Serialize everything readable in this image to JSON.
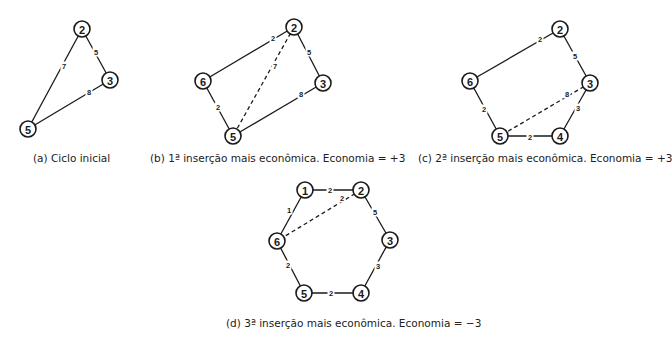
{
  "diagrams": [
    {
      "id": "a",
      "caption": "(a) Ciclo inicial",
      "caption_pos": [
        33,
        152
      ],
      "nodes": [
        {
          "label": "2",
          "x": 82,
          "y": 29
        },
        {
          "label": "3",
          "x": 110,
          "y": 80
        },
        {
          "label": "5",
          "x": 28,
          "y": 129
        }
      ],
      "edges": [
        {
          "from": "2",
          "to": "3",
          "weight": "5",
          "lx": 96,
          "ly": 52,
          "style": "solid"
        },
        {
          "from": "2",
          "to": "5",
          "weight": "7",
          "lx": 64,
          "ly": 66,
          "style": "solid"
        },
        {
          "from": "3",
          "to": "5",
          "weight": "8",
          "lx": 89,
          "ly": 92,
          "style": "solid"
        }
      ]
    },
    {
      "id": "b",
      "caption": "(b) 1ª inserção mais econômica. Economia = +3",
      "caption_pos": [
        150,
        152
      ],
      "nodes": [
        {
          "label": "2",
          "x": 294,
          "y": 27
        },
        {
          "label": "6",
          "x": 203,
          "y": 81
        },
        {
          "label": "3",
          "x": 323,
          "y": 83
        },
        {
          "label": "5",
          "x": 233,
          "y": 136
        }
      ],
      "edges": [
        {
          "from": "2",
          "to": "6",
          "weight": "2",
          "lx": 273,
          "ly": 38,
          "style": "solid"
        },
        {
          "from": "2",
          "to": "3",
          "weight": "5",
          "lx": 309,
          "ly": 52,
          "style": "solid"
        },
        {
          "from": "2",
          "to": "5",
          "weight": "7",
          "lx": 275,
          "ly": 66,
          "style": "dashed"
        },
        {
          "from": "6",
          "to": "5",
          "weight": "2",
          "lx": 218,
          "ly": 107,
          "style": "solid"
        },
        {
          "from": "3",
          "to": "5",
          "weight": "8",
          "lx": 301,
          "ly": 94,
          "style": "solid"
        }
      ]
    },
    {
      "id": "c",
      "caption": "(c) 2ª inserção mais econômica. Economia = +3",
      "caption_pos": [
        418,
        152
      ],
      "nodes": [
        {
          "label": "2",
          "x": 560,
          "y": 29
        },
        {
          "label": "6",
          "x": 470,
          "y": 81
        },
        {
          "label": "3",
          "x": 590,
          "y": 83
        },
        {
          "label": "5",
          "x": 500,
          "y": 136
        },
        {
          "label": "4",
          "x": 560,
          "y": 136
        }
      ],
      "edges": [
        {
          "from": "2",
          "to": "6",
          "weight": "2",
          "lx": 540,
          "ly": 39,
          "style": "solid"
        },
        {
          "from": "2",
          "to": "3",
          "weight": "5",
          "lx": 575,
          "ly": 56,
          "style": "solid"
        },
        {
          "from": "3",
          "to": "5",
          "weight": "8",
          "lx": 567,
          "ly": 94,
          "style": "dashed"
        },
        {
          "from": "3",
          "to": "4",
          "weight": "3",
          "lx": 578,
          "ly": 108,
          "style": "solid"
        },
        {
          "from": "6",
          "to": "5",
          "weight": "2",
          "lx": 484,
          "ly": 109,
          "style": "solid"
        },
        {
          "from": "5",
          "to": "4",
          "weight": "2",
          "lx": 530,
          "ly": 137,
          "style": "solid"
        }
      ]
    },
    {
      "id": "d",
      "caption": "(d) 3ª inserção mais econômica. Economia = −3",
      "caption_pos": [
        226,
        317
      ],
      "nodes": [
        {
          "label": "1",
          "x": 305,
          "y": 190
        },
        {
          "label": "2",
          "x": 361,
          "y": 190
        },
        {
          "label": "6",
          "x": 277,
          "y": 241
        },
        {
          "label": "3",
          "x": 390,
          "y": 240
        },
        {
          "label": "5",
          "x": 304,
          "y": 293
        },
        {
          "label": "4",
          "x": 361,
          "y": 293
        }
      ],
      "edges": [
        {
          "from": "1",
          "to": "2",
          "weight": "2",
          "lx": 330,
          "ly": 190,
          "style": "solid"
        },
        {
          "from": "1",
          "to": "6",
          "weight": "1",
          "lx": 289,
          "ly": 210,
          "style": "solid"
        },
        {
          "from": "2",
          "to": "6",
          "weight": "2",
          "lx": 342,
          "ly": 198,
          "style": "dashed"
        },
        {
          "from": "2",
          "to": "3",
          "weight": "5",
          "lx": 375,
          "ly": 212,
          "style": "solid"
        },
        {
          "from": "3",
          "to": "4",
          "weight": "3",
          "lx": 378,
          "ly": 266,
          "style": "solid"
        },
        {
          "from": "6",
          "to": "5",
          "weight": "2",
          "lx": 288,
          "ly": 265,
          "style": "solid"
        },
        {
          "from": "5",
          "to": "4",
          "weight": "2",
          "lx": 331,
          "ly": 293,
          "style": "solid"
        }
      ]
    }
  ]
}
